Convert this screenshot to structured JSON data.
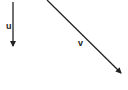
{
  "diagram": {
    "type": "vectors",
    "background": "#ffffff",
    "stroke_color": "#222222",
    "vectors": [
      {
        "label": "u",
        "from": [
          13,
          2
        ],
        "to": [
          13,
          47
        ],
        "direction": "down"
      },
      {
        "label": "v",
        "from": [
          47,
          0
        ],
        "to": [
          122,
          74
        ],
        "direction": "down-right"
      }
    ]
  }
}
